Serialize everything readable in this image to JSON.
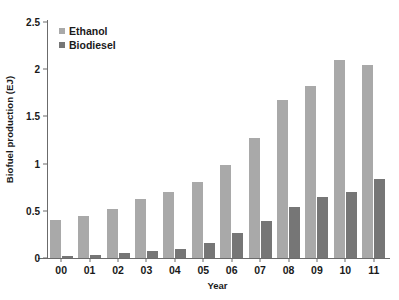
{
  "chart_data": {
    "type": "bar",
    "title": "",
    "xlabel": "Year",
    "ylabel": "Biofuel production (EJ)",
    "categories": [
      "00",
      "01",
      "02",
      "03",
      "04",
      "05",
      "06",
      "07",
      "08",
      "09",
      "10",
      "11"
    ],
    "series": [
      {
        "name": "Ethanol",
        "color": "#a9a9a9",
        "values": [
          0.4,
          0.44,
          0.52,
          0.63,
          0.7,
          0.8,
          0.99,
          1.27,
          1.67,
          1.82,
          2.1,
          2.04
        ]
      },
      {
        "name": "Biodiesel",
        "color": "#767676",
        "values": [
          0.02,
          0.03,
          0.05,
          0.07,
          0.1,
          0.16,
          0.27,
          0.39,
          0.54,
          0.65,
          0.7,
          0.84
        ]
      }
    ],
    "ylim": [
      0,
      2.5
    ],
    "yticks": [
      "0",
      "0.5",
      "1",
      "1.5",
      "2",
      "2.5"
    ],
    "ytick_values": [
      0,
      0.5,
      1,
      1.5,
      2,
      2.5
    ],
    "grid": false,
    "legend_position": "top-left",
    "axis_color": "#6b6b6b"
  },
  "legend": {
    "entries": [
      {
        "label": "Ethanol"
      },
      {
        "label": "Biodiesel"
      }
    ]
  }
}
